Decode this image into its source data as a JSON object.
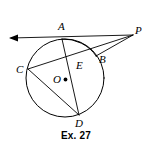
{
  "figure": {
    "caption": "Ex. 27",
    "background_color": "#ffffff",
    "line_color": "#000000",
    "width": 152,
    "height": 150
  },
  "labels": {
    "A": "A",
    "B": "B",
    "C": "C",
    "D": "D",
    "E": "E",
    "O": "O",
    "P": "P"
  },
  "geometry": {
    "circle": {
      "cx": 65,
      "cy": 78,
      "r": 39
    },
    "center_dot": {
      "cx": 65.5,
      "cy": 79.5,
      "r": 1.8
    },
    "points": {
      "A": {
        "x": 62,
        "y": 39
      },
      "B": {
        "x": 96,
        "y": 56
      },
      "C": {
        "x": 28,
        "y": 69
      },
      "D": {
        "x": 79,
        "y": 115
      },
      "E": {
        "x": 74,
        "y": 62
      },
      "O": {
        "x": 65,
        "y": 78
      },
      "P": {
        "x": 133,
        "y": 35
      }
    },
    "tangent_line": {
      "x1": 11,
      "y1": 38,
      "x2": 133,
      "y2": 35
    },
    "arrow_tip": {
      "x": 9,
      "y": 38
    },
    "secant_C_to_P": {
      "x1": 28,
      "y1": 69,
      "x2": 133,
      "y2": 35
    },
    "chord_A_to_D": {
      "x1": 62,
      "y1": 39,
      "x2": 79,
      "y2": 115
    },
    "chord_C_to_D": {
      "x1": 28,
      "y1": 69,
      "x2": 79,
      "y2": 115
    },
    "segment_B_to_P": {
      "x1": 96,
      "y1": 56,
      "x2": 133,
      "y2": 35
    },
    "arc_A_to_B": {
      "start_x": 62,
      "start_y": 39,
      "end_x": 96,
      "end_y": 56
    }
  }
}
